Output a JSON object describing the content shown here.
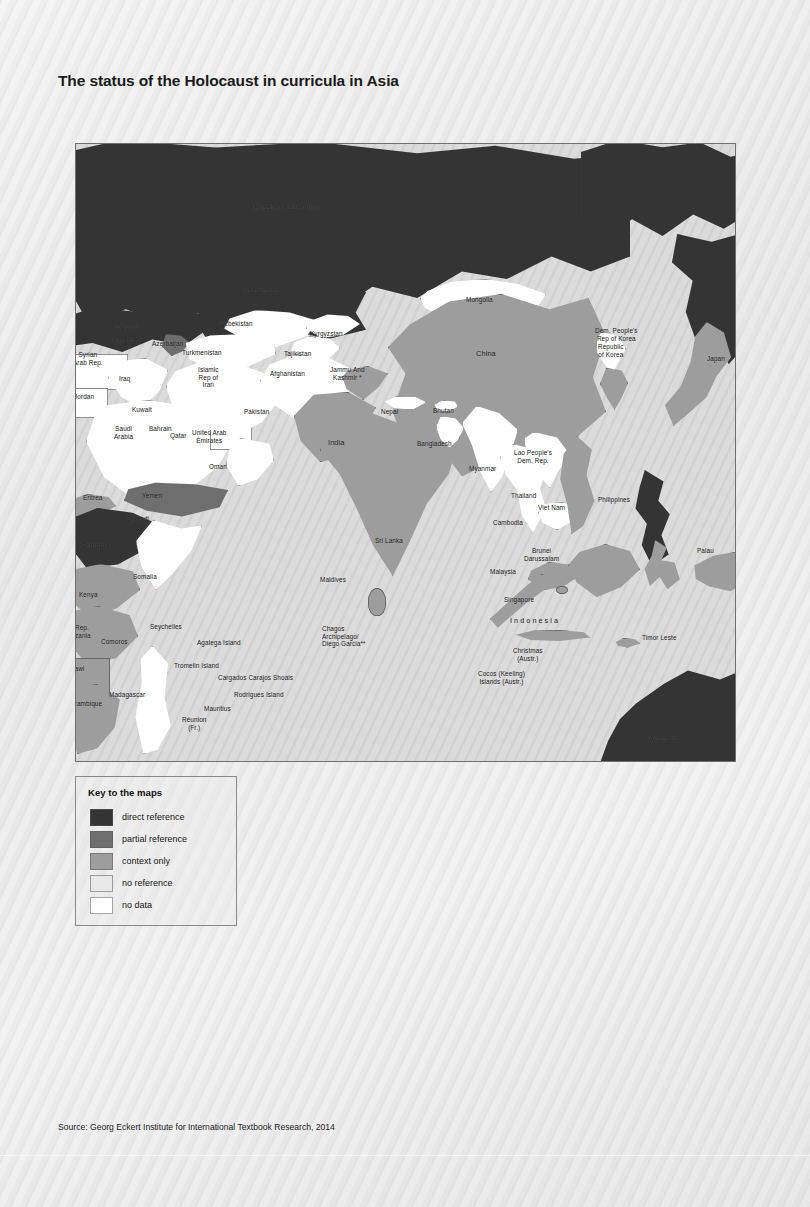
{
  "figure": {
    "title": "The status of the Holocaust in curricula in Asia",
    "source": "Source: Georg Eckert Institute for International Textbook Research, 2014",
    "source_prefix": "Source:"
  },
  "legend": {
    "title": "Key to the maps",
    "items": [
      {
        "label": "direct reference",
        "color": "#343434",
        "class": "sh-direct"
      },
      {
        "label": "partial reference",
        "color": "#6e6e6e",
        "class": "sh-partial"
      },
      {
        "label": "context only",
        "color": "#9d9d9d",
        "class": "sh-context"
      },
      {
        "label": "no reference",
        "color": "#e9e9e9",
        "class": "sh-noref"
      },
      {
        "label": "no data",
        "color": "#ffffff",
        "class": "sh-nodata"
      }
    ]
  },
  "map": {
    "region": "Asia",
    "labels": [
      {
        "text": "Russian Federation",
        "status": "direct reference"
      },
      {
        "text": "Kazakhstan",
        "status": "direct reference"
      },
      {
        "text": "Mongolia",
        "status": "no data"
      },
      {
        "text": "China",
        "status": "context only"
      },
      {
        "text": "Dem. People's\nRep of Korea",
        "status": "no data"
      },
      {
        "text": "Republic\nof Korea",
        "status": "context only"
      },
      {
        "text": "Japan",
        "status": "context only"
      },
      {
        "text": "Georgia",
        "status": "direct reference"
      },
      {
        "text": "Armenia",
        "status": "direct reference"
      },
      {
        "text": "Azerbaijan",
        "status": "partial reference"
      },
      {
        "text": "Uzbekistan",
        "status": "no data"
      },
      {
        "text": "Turkmenistan",
        "status": "no data"
      },
      {
        "text": "Kyrgyzstan",
        "status": "no data"
      },
      {
        "text": "Tajikistan",
        "status": "no data"
      },
      {
        "text": "Afghanistan",
        "status": "no data"
      },
      {
        "text": "Islamic\nRep of\nIran",
        "status": "no data"
      },
      {
        "text": "Syrian\nArab Rep.",
        "status": "no data"
      },
      {
        "text": "Iraq",
        "status": "no data"
      },
      {
        "text": "Jordan",
        "status": "no data"
      },
      {
        "text": "Kuwait",
        "status": "no data"
      },
      {
        "text": "Bahrain",
        "status": "no data"
      },
      {
        "text": "Qatar",
        "status": "no data"
      },
      {
        "text": "Saudi\nArabia",
        "status": "no data"
      },
      {
        "text": "United Arab\nEmirates",
        "status": "no data"
      },
      {
        "text": "Oman",
        "status": "no data"
      },
      {
        "text": "Yemen",
        "status": "partial reference"
      },
      {
        "text": "Djibouti",
        "status": "no data"
      },
      {
        "text": "Eritrea",
        "status": "context only"
      },
      {
        "text": "Ethiopia",
        "status": "direct reference"
      },
      {
        "text": "Somalia",
        "status": "no data"
      },
      {
        "text": "Kenya",
        "status": "context only"
      },
      {
        "text": "Rep.\nzania",
        "status": "context only"
      },
      {
        "text": "lawi",
        "status": "context only"
      },
      {
        "text": "ozambique",
        "status": "context only"
      },
      {
        "text": "Comoros",
        "status": "context only"
      },
      {
        "text": "Madagascar",
        "status": "no data"
      },
      {
        "text": "Seychelles",
        "status": "context only"
      },
      {
        "text": "Agalega Island",
        "status": "context only"
      },
      {
        "text": "Tromelin Island",
        "status": "context only"
      },
      {
        "text": "Cargados Carajos Shoals",
        "status": "context only"
      },
      {
        "text": "Rodrigues Island",
        "status": "context only"
      },
      {
        "text": "Mauritius",
        "status": "context only"
      },
      {
        "text": "Réunion\n(Fr.)",
        "status": "context only"
      },
      {
        "text": "Chagos\nArchipelago/\nDiego Garcia**",
        "status": "context only"
      },
      {
        "text": "Pakistan",
        "status": "context only"
      },
      {
        "text": "Jammu And\nKashmir *",
        "status": "context only"
      },
      {
        "text": "India",
        "status": "context only"
      },
      {
        "text": "Nepal",
        "status": "no data"
      },
      {
        "text": "Bhutan",
        "status": "no data"
      },
      {
        "text": "Bangladesh",
        "status": "no data"
      },
      {
        "text": "Myanmar",
        "status": "no data"
      },
      {
        "text": "Sri Lanka",
        "status": "context only"
      },
      {
        "text": "Maldives",
        "status": "context only"
      },
      {
        "text": "Thailand",
        "status": "no data"
      },
      {
        "text": "Lao People's\nDem. Rep.",
        "status": "no data"
      },
      {
        "text": "Cambodia",
        "status": "no data"
      },
      {
        "text": "Viet Nam",
        "status": "context only"
      },
      {
        "text": "Malaysia",
        "status": "context only"
      },
      {
        "text": "Brunei\nDarussalam",
        "status": "context only"
      },
      {
        "text": "Singapore",
        "status": "context only"
      },
      {
        "text": "Philippines",
        "status": "direct reference"
      },
      {
        "text": "Indonesia",
        "status": "context only"
      },
      {
        "text": "Timor Leste",
        "status": "context only"
      },
      {
        "text": "Palau",
        "status": "context only"
      },
      {
        "text": "Christmas\n(Austr.)",
        "status": "context only"
      },
      {
        "text": "Cocos (Keeling)\nIslands (Austr.)",
        "status": "context only"
      },
      {
        "text": "Australia",
        "status": "direct reference"
      }
    ]
  }
}
